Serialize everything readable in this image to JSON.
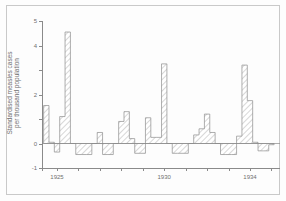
{
  "figure": {
    "border_color": "#c9c9c9",
    "axis_color": "#8a8a8a",
    "text_color": "#6f6f6f",
    "hatch_color": "#8d8d8d",
    "bar_fill": "#ffffff"
  },
  "axes": {
    "ylabel_line1": "Standardised measles cases",
    "ylabel_line2": "per thousand population",
    "y_ticks": [
      {
        "value": 5,
        "label": "5"
      },
      {
        "value": 4,
        "label": "4"
      },
      {
        "value": 3,
        "label": ""
      },
      {
        "value": 2,
        "label": "2"
      },
      {
        "value": 1,
        "label": ""
      },
      {
        "value": 0,
        "label": "0"
      },
      {
        "value": -1,
        "label": "-1"
      }
    ],
    "x_ticks": [
      {
        "value": 1925,
        "label": "1925"
      },
      {
        "value": 1926,
        "label": ""
      },
      {
        "value": 1927,
        "label": ""
      },
      {
        "value": 1928,
        "label": ""
      },
      {
        "value": 1929,
        "label": ""
      },
      {
        "value": 1930,
        "label": "1930"
      },
      {
        "value": 1931,
        "label": ""
      },
      {
        "value": 1932,
        "label": ""
      },
      {
        "value": 1933,
        "label": ""
      },
      {
        "value": 1934,
        "label": "1934"
      },
      {
        "value": 1935,
        "label": ""
      }
    ]
  },
  "chart_data": {
    "type": "bar",
    "title": "",
    "subtitle": "",
    "xlabel": "",
    "ylabel": "Standardised measles cases per thousand population",
    "xlim": [
      1924.3,
      1935.4
    ],
    "ylim": [
      -1,
      5
    ],
    "grid": false,
    "legend": null,
    "bar_style": "diagonal-hatch step histogram",
    "x_tick_labels": [
      "1925",
      "1930",
      "1934"
    ],
    "y_tick_labels": [
      "5",
      "4",
      "2",
      "0",
      "-1"
    ],
    "note": "Quarterly standardised measles case rates; epidemic peaks roughly every 2 years with negative (below-average) troughs between.",
    "x": [
      1924.5,
      1924.75,
      1925.0,
      1925.25,
      1925.5,
      1925.75,
      1926.0,
      1926.25,
      1926.5,
      1926.75,
      1927.0,
      1927.25,
      1927.5,
      1927.75,
      1928.0,
      1928.25,
      1928.5,
      1928.75,
      1929.0,
      1929.25,
      1929.5,
      1929.75,
      1930.0,
      1930.25,
      1930.5,
      1930.75,
      1931.0,
      1931.25,
      1931.5,
      1931.75,
      1932.0,
      1932.25,
      1932.5,
      1932.75,
      1933.0,
      1933.25,
      1933.5,
      1933.75,
      1934.0,
      1934.25,
      1934.5,
      1934.75,
      1935.0
    ],
    "values": [
      1.55,
      0.05,
      -0.35,
      1.1,
      4.55,
      0.0,
      -0.45,
      -0.45,
      -0.45,
      0.0,
      0.45,
      -0.45,
      -0.45,
      0.0,
      0.9,
      1.3,
      0.2,
      -0.4,
      -0.4,
      1.05,
      0.25,
      0.25,
      3.25,
      0.0,
      -0.4,
      -0.4,
      -0.4,
      0.0,
      0.35,
      0.6,
      1.2,
      0.45,
      0.0,
      -0.45,
      -0.45,
      -0.45,
      0.3,
      3.2,
      1.75,
      0.05,
      -0.3,
      -0.3,
      -0.05
    ],
    "series": [
      {
        "name": "Standardised measles cases per thousand population",
        "values": [
          1.55,
          0.05,
          -0.35,
          1.1,
          4.55,
          0.0,
          -0.45,
          -0.45,
          -0.45,
          0.0,
          0.45,
          -0.45,
          -0.45,
          0.0,
          0.9,
          1.3,
          0.2,
          -0.4,
          -0.4,
          1.05,
          0.25,
          0.25,
          3.25,
          0.0,
          -0.4,
          -0.4,
          -0.4,
          0.0,
          0.35,
          0.6,
          1.2,
          0.45,
          0.0,
          -0.45,
          -0.45,
          -0.45,
          0.3,
          3.2,
          1.75,
          0.05,
          -0.3,
          -0.3,
          -0.05
        ]
      }
    ]
  }
}
